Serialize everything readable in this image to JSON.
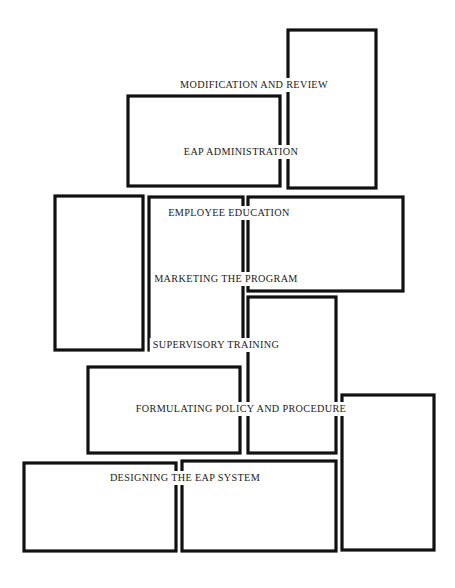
{
  "diagram": {
    "type": "staircase-flow-diagram",
    "title": "",
    "background_color": "#ffffff",
    "stroke_color": "#111111",
    "text_color": "#191919",
    "stages": [
      {
        "id": "modification-and-review",
        "label": "MODIFICATION AND REVIEW",
        "order": 7,
        "label_x": 254,
        "label_y": 85
      },
      {
        "id": "eap-administration",
        "label": "EAP ADMINISTRATION",
        "order": 6,
        "label_x": 241,
        "label_y": 152
      },
      {
        "id": "employee-education",
        "label": "EMPLOYEE EDUCATION",
        "order": 5,
        "label_x": 229,
        "label_y": 213
      },
      {
        "id": "marketing-the-program",
        "label": "MARKETING THE PROGRAM",
        "order": 4,
        "label_x": 226,
        "label_y": 279
      },
      {
        "id": "supervisory-training",
        "label": "SUPERVISORY TRAINING",
        "order": 3,
        "label_x": 216,
        "label_y": 345
      },
      {
        "id": "formulating-policy-and-procedure",
        "label": "FORMULATING POLICY AND PROCEDURE",
        "order": 2,
        "label_x": 241,
        "label_y": 409
      },
      {
        "id": "designing-the-eap-system",
        "label": "DESIGNING THE EAP SYSTEM",
        "order": 1,
        "label_x": 185,
        "label_y": 478
      }
    ],
    "blocks": [
      {
        "id": "block-top-right",
        "x": 288,
        "y": 30,
        "w": 88,
        "h": 158
      },
      {
        "id": "block-eap-admin",
        "x": 128,
        "y": 96,
        "w": 152,
        "h": 90
      },
      {
        "id": "block-left-upper",
        "x": 55,
        "y": 196,
        "w": 88,
        "h": 154
      },
      {
        "id": "block-middle-column",
        "x": 149,
        "y": 197,
        "w": 94,
        "h": 153
      },
      {
        "id": "block-right-wide",
        "x": 248,
        "y": 197,
        "w": 155,
        "h": 94
      },
      {
        "id": "block-formulating",
        "x": 88,
        "y": 367,
        "w": 152,
        "h": 86
      },
      {
        "id": "block-mid-lower",
        "x": 248,
        "y": 297,
        "w": 88,
        "h": 156
      },
      {
        "id": "block-bottom-left",
        "x": 24,
        "y": 463,
        "w": 152,
        "h": 88
      },
      {
        "id": "block-bottom-middle",
        "x": 182,
        "y": 461,
        "w": 154,
        "h": 90
      },
      {
        "id": "block-bottom-right",
        "x": 342,
        "y": 395,
        "w": 92,
        "h": 155
      }
    ]
  }
}
